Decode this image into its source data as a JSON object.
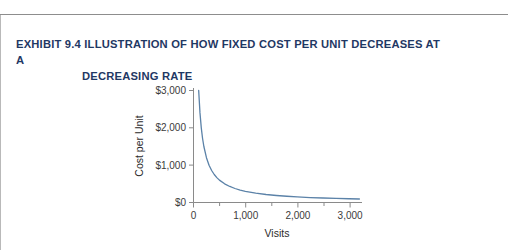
{
  "exhibit": {
    "title_line1": "EXHIBIT 9.4  ILLUSTRATION OF HOW FIXED COST PER UNIT DECREASES AT A",
    "title_line2": "DECREASING RATE",
    "title_color": "#1f3864"
  },
  "chart_data": {
    "type": "line",
    "title": "",
    "subtitle": "",
    "xlabel": "Visits",
    "ylabel": "Cost per Unit",
    "xlim": [
      0,
      3250
    ],
    "ylim": [
      0,
      3000
    ],
    "grid": false,
    "legend": null,
    "line_color": "#5b82a8",
    "axis_color": "#8a8a8a",
    "xticks": [
      0,
      1000,
      2000,
      3000
    ],
    "xtick_labels": [
      "0",
      "1,000",
      "2,000",
      "3,000"
    ],
    "xminor_ticks": [
      500,
      1500,
      2500
    ],
    "yticks": [
      0,
      1000,
      2000,
      3000
    ],
    "ytick_labels": [
      "$0",
      "$1,000",
      "$2,000",
      "$3,000"
    ],
    "annotations": [],
    "series": [
      {
        "name": "Fixed cost per unit",
        "formula": "y = 300000 / x",
        "x": [
          100,
          125,
          150,
          175,
          200,
          250,
          300,
          350,
          400,
          450,
          500,
          600,
          700,
          800,
          900,
          1000,
          1200,
          1400,
          1600,
          1800,
          2000,
          2250,
          2500,
          2750,
          3000,
          3200
        ],
        "y": [
          3000,
          2400,
          2000,
          1714,
          1500,
          1200,
          1000,
          857,
          750,
          667,
          600,
          500,
          429,
          375,
          333,
          300,
          250,
          214,
          188,
          167,
          150,
          133,
          120,
          109,
          100,
          94
        ]
      }
    ]
  }
}
